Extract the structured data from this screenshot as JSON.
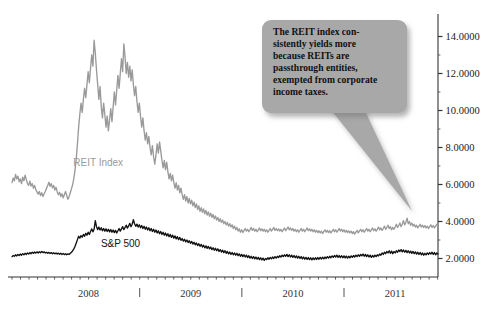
{
  "chart_data": {
    "type": "line",
    "title": "",
    "xlabel": "",
    "ylabel": "",
    "ylim": [
      1.0,
      15.0
    ],
    "yticks": [
      2.0,
      4.0,
      6.0,
      8.0,
      10.0,
      12.0,
      14.0
    ],
    "ytick_labels": [
      "2.0000",
      "4.0000",
      "6.0000",
      "8.0000",
      "10.0000",
      "12.0000",
      "14.0000"
    ],
    "yaxis_position": "right",
    "minor_ticks": true,
    "grid": false,
    "legend": "inline-labels",
    "xtick_labels": [
      "2008",
      "2009",
      "2010",
      "2011"
    ],
    "x_range": [
      2007.75,
      2011.92
    ],
    "series": [
      {
        "name": "REIT Index",
        "color": "#9a9a9a",
        "label_x": 2008.35,
        "label_y": 7.0,
        "values": [
          6.1,
          6.35,
          6.2,
          6.55,
          6.3,
          6.45,
          6.15,
          6.3,
          6.05,
          6.4,
          6.2,
          6.5,
          6.28,
          6.05,
          5.95,
          6.18,
          5.92,
          6.05,
          5.8,
          5.95,
          5.72,
          5.6,
          5.48,
          5.62,
          5.4,
          5.55,
          5.35,
          5.5,
          5.62,
          5.8,
          5.95,
          6.12,
          5.9,
          6.05,
          5.82,
          5.95,
          5.7,
          5.85,
          5.6,
          5.45,
          5.58,
          5.35,
          5.5,
          5.28,
          5.45,
          5.62,
          5.4,
          5.2,
          5.35,
          5.55,
          5.78,
          6.0,
          6.35,
          6.8,
          7.4,
          8.2,
          9.1,
          9.8,
          10.4,
          9.9,
          10.6,
          11.2,
          10.7,
          11.4,
          12.1,
          11.5,
          12.3,
          13.0,
          12.4,
          13.8,
          13.1,
          12.2,
          11.4,
          10.6,
          11.3,
          10.2,
          9.6,
          10.4,
          9.8,
          9.1,
          9.7,
          8.9,
          9.5,
          10.1,
          9.4,
          10.2,
          11.0,
          10.3,
          11.1,
          11.9,
          11.2,
          12.0,
          12.8,
          12.1,
          13.6,
          12.9,
          12.0,
          12.6,
          11.8,
          12.4,
          11.6,
          12.2,
          11.4,
          10.8,
          11.3,
          10.5,
          9.9,
          10.4,
          9.7,
          9.1,
          9.6,
          8.9,
          8.4,
          8.8,
          8.2,
          8.6,
          8.0,
          7.6,
          8.1,
          7.5,
          7.1,
          7.6,
          8.2,
          7.7,
          8.3,
          7.8,
          7.3,
          6.9,
          7.3,
          6.8,
          7.2,
          6.7,
          6.3,
          6.6,
          6.2,
          6.5,
          6.1,
          5.8,
          6.1,
          5.7,
          5.95,
          5.55,
          5.8,
          5.45,
          5.2,
          5.45,
          5.1,
          5.35,
          5.0,
          5.25,
          4.95,
          5.15,
          4.85,
          5.05,
          4.75,
          4.95,
          4.65,
          4.85,
          4.55,
          4.75,
          4.5,
          4.68,
          4.42,
          4.6,
          4.35,
          4.52,
          4.28,
          4.45,
          4.22,
          4.38,
          4.15,
          4.3,
          4.08,
          4.22,
          4.0,
          4.15,
          3.95,
          4.08,
          3.88,
          4.0,
          3.82,
          3.95,
          3.75,
          3.88,
          3.7,
          3.82,
          3.62,
          3.75,
          3.55,
          3.68,
          3.48,
          3.6,
          3.42,
          3.55,
          3.4,
          3.52,
          3.62,
          3.48,
          3.58,
          3.45,
          3.55,
          3.68,
          3.52,
          3.62,
          3.48,
          3.58,
          3.45,
          3.55,
          3.65,
          3.5,
          3.6,
          3.48,
          3.58,
          3.45,
          3.55,
          3.42,
          3.52,
          3.62,
          3.48,
          3.58,
          3.68,
          3.52,
          3.62,
          3.5,
          3.6,
          3.48,
          3.58,
          3.45,
          3.55,
          3.65,
          3.5,
          3.6,
          3.7,
          3.55,
          3.65,
          3.52,
          3.62,
          3.48,
          3.58,
          3.45,
          3.55,
          3.42,
          3.52,
          3.62,
          3.48,
          3.58,
          3.45,
          3.55,
          3.65,
          3.5,
          3.6,
          3.48,
          3.58,
          3.45,
          3.55,
          3.42,
          3.52,
          3.4,
          3.5,
          3.38,
          3.48,
          3.35,
          3.45,
          3.55,
          3.42,
          3.52,
          3.4,
          3.5,
          3.38,
          3.48,
          3.58,
          3.45,
          3.55,
          3.42,
          3.52,
          3.62,
          3.48,
          3.58,
          3.45,
          3.55,
          3.42,
          3.52,
          3.4,
          3.5,
          3.38,
          3.48,
          3.35,
          3.45,
          3.32,
          3.42,
          3.52,
          3.38,
          3.48,
          3.58,
          3.45,
          3.55,
          3.42,
          3.52,
          3.62,
          3.48,
          3.58,
          3.45,
          3.55,
          3.65,
          3.5,
          3.6,
          3.48,
          3.58,
          3.7,
          3.55,
          3.65,
          3.52,
          3.62,
          3.75,
          3.58,
          3.68,
          3.8,
          3.62,
          3.72,
          3.55,
          3.68,
          3.58,
          3.7,
          3.85,
          3.68,
          3.78,
          3.92,
          3.72,
          3.85,
          4.05,
          3.82,
          3.95,
          4.18,
          3.88,
          4.0,
          3.8,
          3.92,
          3.75,
          3.85,
          3.7,
          3.8,
          3.65,
          3.75,
          3.85,
          3.7,
          3.8,
          3.68,
          3.78,
          3.65,
          3.75,
          3.62,
          3.72,
          3.82,
          3.68,
          3.78,
          3.65,
          3.75,
          3.85,
          3.7
        ]
      },
      {
        "name": "S&P 500",
        "color": "#111111",
        "label_x": 2008.62,
        "label_y": 2.62,
        "values": [
          2.1,
          2.16,
          2.12,
          2.2,
          2.14,
          2.22,
          2.16,
          2.24,
          2.18,
          2.26,
          2.2,
          2.28,
          2.22,
          2.3,
          2.24,
          2.32,
          2.26,
          2.34,
          2.28,
          2.35,
          2.29,
          2.36,
          2.3,
          2.37,
          2.31,
          2.38,
          2.32,
          2.36,
          2.3,
          2.34,
          2.28,
          2.33,
          2.27,
          2.32,
          2.26,
          2.31,
          2.25,
          2.3,
          2.24,
          2.29,
          2.23,
          2.28,
          2.22,
          2.27,
          2.21,
          2.26,
          2.2,
          2.25,
          2.22,
          2.28,
          2.34,
          2.42,
          2.52,
          2.66,
          2.84,
          3.02,
          3.2,
          3.1,
          3.24,
          3.15,
          3.3,
          3.2,
          3.36,
          3.26,
          3.42,
          3.3,
          3.46,
          3.6,
          3.44,
          3.58,
          4.05,
          3.72,
          3.56,
          3.7,
          3.54,
          3.66,
          3.5,
          3.62,
          3.48,
          3.6,
          3.46,
          3.58,
          3.44,
          3.56,
          3.42,
          3.54,
          3.4,
          3.52,
          3.38,
          3.5,
          3.62,
          3.48,
          3.6,
          3.72,
          3.56,
          3.68,
          3.8,
          3.64,
          3.76,
          3.9,
          3.72,
          3.85,
          4.1,
          3.88,
          3.74,
          3.86,
          3.7,
          3.82,
          3.66,
          3.78,
          3.62,
          3.74,
          3.58,
          3.7,
          3.54,
          3.66,
          3.5,
          3.62,
          3.46,
          3.58,
          3.42,
          3.54,
          3.38,
          3.5,
          3.34,
          3.46,
          3.3,
          3.42,
          3.26,
          3.38,
          3.22,
          3.34,
          3.18,
          3.3,
          3.14,
          3.26,
          3.1,
          3.22,
          3.06,
          3.18,
          3.02,
          3.14,
          2.98,
          3.08,
          2.94,
          3.04,
          2.9,
          3.0,
          2.86,
          2.96,
          2.82,
          2.92,
          2.78,
          2.88,
          2.74,
          2.84,
          2.7,
          2.8,
          2.66,
          2.76,
          2.62,
          2.72,
          2.58,
          2.68,
          2.55,
          2.65,
          2.52,
          2.62,
          2.48,
          2.58,
          2.45,
          2.55,
          2.42,
          2.52,
          2.38,
          2.48,
          2.35,
          2.45,
          2.32,
          2.42,
          2.28,
          2.38,
          2.25,
          2.35,
          2.22,
          2.32,
          2.2,
          2.3,
          2.18,
          2.28,
          2.15,
          2.25,
          2.12,
          2.22,
          2.1,
          2.2,
          2.08,
          2.18,
          2.05,
          2.15,
          2.02,
          2.12,
          2.0,
          2.1,
          1.98,
          2.08,
          1.96,
          2.06,
          1.94,
          2.04,
          1.92,
          2.02,
          1.9,
          2.0,
          1.94,
          2.04,
          1.96,
          2.06,
          1.98,
          2.08,
          2.0,
          2.1,
          2.02,
          2.12,
          2.05,
          2.15,
          2.08,
          2.18,
          2.1,
          2.2,
          2.12,
          2.22,
          2.1,
          2.2,
          2.08,
          2.18,
          2.06,
          2.16,
          2.04,
          2.14,
          2.02,
          2.12,
          2.0,
          2.1,
          1.98,
          2.08,
          1.96,
          2.06,
          1.95,
          2.05,
          1.94,
          2.04,
          1.93,
          2.03,
          1.94,
          2.04,
          1.95,
          2.05,
          1.96,
          2.06,
          1.97,
          2.07,
          1.98,
          2.08,
          2.0,
          2.1,
          2.02,
          2.12,
          2.04,
          2.14,
          2.06,
          2.16,
          2.08,
          2.18,
          2.06,
          2.16,
          2.05,
          2.15,
          2.04,
          2.14,
          2.03,
          2.13,
          2.02,
          2.12,
          2.04,
          2.14,
          2.06,
          2.16,
          2.08,
          2.18,
          2.1,
          2.2,
          2.12,
          2.22,
          2.14,
          2.24,
          2.12,
          2.22,
          2.1,
          2.2,
          2.08,
          2.18,
          2.06,
          2.16,
          2.08,
          2.18,
          2.1,
          2.2,
          2.14,
          2.24,
          2.18,
          2.3,
          2.22,
          2.34,
          2.26,
          2.38,
          2.3,
          2.42,
          2.28,
          2.4,
          2.26,
          2.38,
          2.3,
          2.42,
          2.34,
          2.46,
          2.38,
          2.48,
          2.36,
          2.46,
          2.34,
          2.44,
          2.32,
          2.42,
          2.3,
          2.4,
          2.28,
          2.38,
          2.26,
          2.36,
          2.24,
          2.34,
          2.22,
          2.32,
          2.2,
          2.3,
          2.18,
          2.28,
          2.2,
          2.3,
          2.22,
          2.32,
          2.24,
          2.34,
          2.22,
          2.32,
          2.2,
          2.3,
          2.24
        ]
      }
    ]
  },
  "callout": {
    "text": "The REIT index con-\nsistently yields more\nbecause REITs are\npassthrough entities,\nexempted from corporate\nincome taxes.",
    "fill_color": "#a8a8a8",
    "points_to": "REIT Index line near 2011"
  },
  "axes": {
    "y_axis_side": "right",
    "x_axis_years": [
      "2008",
      "2009",
      "2010",
      "2011"
    ]
  }
}
